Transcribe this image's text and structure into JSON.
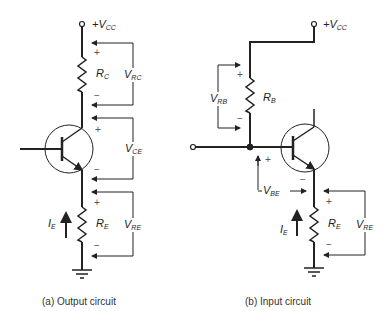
{
  "panel_a": {
    "caption": "(a) Output circuit",
    "supply": {
      "prefix": "+V",
      "sub": "CC"
    },
    "rc": {
      "main": "R",
      "sub": "C"
    },
    "vrc": {
      "main": "V",
      "sub": "RC"
    },
    "vce": {
      "main": "V",
      "sub": "CE"
    },
    "re": {
      "main": "R",
      "sub": "E"
    },
    "vre": {
      "main": "V",
      "sub": "RE"
    },
    "ie": {
      "main": "I",
      "sub": "E"
    },
    "plus": "+",
    "minus": "−"
  },
  "panel_b": {
    "caption": "(b) Input circuit",
    "supply": {
      "prefix": "+V",
      "sub": "CC"
    },
    "rb": {
      "main": "R",
      "sub": "B"
    },
    "vrb": {
      "main": "V",
      "sub": "RB"
    },
    "vbe": {
      "main": "V",
      "sub": "BE"
    },
    "re": {
      "main": "R",
      "sub": "E"
    },
    "vre": {
      "main": "V",
      "sub": "RE"
    },
    "ie": {
      "main": "I",
      "sub": "E"
    },
    "plus": "+",
    "minus": "−"
  }
}
